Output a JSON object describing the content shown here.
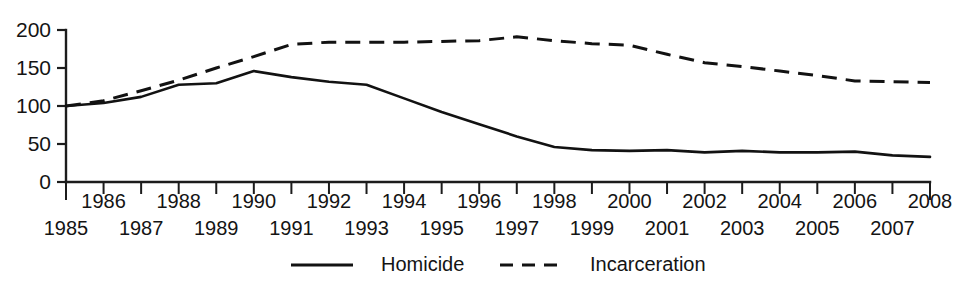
{
  "chart_data": {
    "type": "line",
    "title": "",
    "xlabel": "",
    "ylabel": "",
    "xlim": [
      1985,
      2008
    ],
    "ylim": [
      0,
      200
    ],
    "grid": false,
    "legend_position": "bottom-center",
    "y_ticks": [
      0,
      50,
      100,
      150,
      200
    ],
    "y_tick_labels": [
      "0",
      "50",
      "100",
      "150",
      "200"
    ],
    "x": [
      1985,
      1986,
      1987,
      1988,
      1989,
      1990,
      1991,
      1992,
      1993,
      1994,
      1995,
      1996,
      1997,
      1998,
      1999,
      2000,
      2001,
      2002,
      2003,
      2004,
      2005,
      2006,
      2007,
      2008
    ],
    "x_tick_labels_upper": [
      "",
      "1986",
      "",
      "1988",
      "",
      "1990",
      "",
      "1992",
      "",
      "1994",
      "",
      "1996",
      "",
      "1998",
      "",
      "2000",
      "",
      "2002",
      "",
      "2004",
      "",
      "2006",
      "",
      "2008"
    ],
    "x_tick_labels_lower": [
      "1985",
      "",
      "1987",
      "",
      "1989",
      "",
      "1991",
      "",
      "1993",
      "",
      "1995",
      "",
      "1997",
      "",
      "1999",
      "",
      "2001",
      "",
      "2003",
      "",
      "2005",
      "",
      "2007",
      ""
    ],
    "series": [
      {
        "name": "Homicide",
        "style": "solid",
        "color": "#121212",
        "values": [
          100,
          104,
          112,
          128,
          130,
          146,
          138,
          132,
          128,
          110,
          92,
          76,
          60,
          46,
          42,
          41,
          42,
          39,
          41,
          39,
          39,
          40,
          35,
          33
        ]
      },
      {
        "name": "Incarceration",
        "style": "dashed",
        "color": "#121212",
        "values": [
          100,
          107,
          120,
          134,
          150,
          165,
          181,
          184,
          184,
          184,
          185,
          186,
          191,
          186,
          182,
          180,
          168,
          157,
          152,
          146,
          140,
          133,
          132,
          131
        ]
      }
    ]
  },
  "legend": {
    "items": [
      {
        "label": "Homicide",
        "style": "solid"
      },
      {
        "label": "Incarceration",
        "style": "dashed"
      }
    ]
  }
}
